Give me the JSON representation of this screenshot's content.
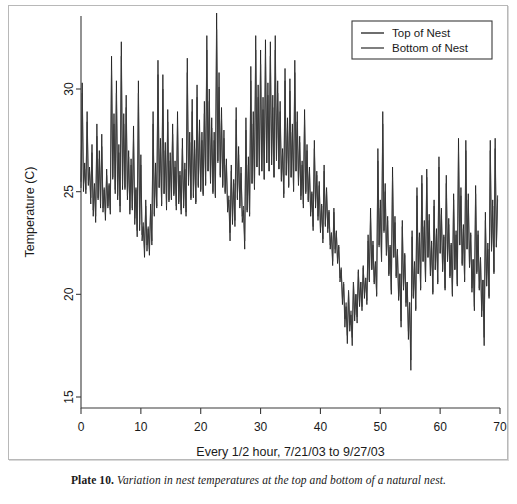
{
  "caption": {
    "plate": "Plate 10.",
    "text": "Variation in nest temperatures at the top and bottom of a natural nest."
  },
  "chart_data": {
    "type": "line",
    "title": "",
    "xlabel": "Every 1/2 hour, 7/21/03 to 9/27/03",
    "ylabel": "Temperature (C)",
    "xlim": [
      0,
      70
    ],
    "ylim": [
      15,
      33.8
    ],
    "xticks": [
      0,
      10,
      20,
      30,
      40,
      50,
      60,
      70
    ],
    "yticks": [
      15,
      20,
      25,
      30
    ],
    "xticklabels": [
      "0",
      "10",
      "20",
      "30",
      "40",
      "50",
      "60",
      "70"
    ],
    "yticklabels": [
      "15",
      "20",
      "25",
      "30"
    ],
    "grid": false,
    "legend_position": "top-right",
    "legend_entries": [
      "Top of Nest",
      "Bottom of Nest"
    ],
    "colors": {
      "top": "#1f1f1f",
      "bottom": "#3a3a3a",
      "axis": "#3b3b3b",
      "frame": "#b8b8b8"
    },
    "x_start": 0,
    "x_end": 69.6,
    "n_points": 349,
    "series": [
      {
        "name": "Top of Nest",
        "values": [
          25.2,
          30.3,
          25.0,
          26.4,
          24.9,
          28.9,
          25.3,
          26.2,
          24.4,
          27.3,
          23.8,
          25.4,
          23.5,
          28.3,
          24.6,
          27.0,
          24.2,
          27.8,
          24.0,
          25.1,
          23.6,
          26.1,
          24.2,
          25.4,
          23.9,
          31.6,
          25.6,
          28.8,
          24.9,
          30.4,
          24.6,
          27.3,
          24.0,
          32.3,
          25.1,
          28.8,
          25.1,
          29.7,
          24.6,
          27.0,
          23.9,
          26.6,
          24.1,
          28.2,
          23.4,
          25.2,
          22.8,
          30.4,
          23.1,
          26.8,
          22.6,
          23.3,
          21.8,
          24.6,
          22.1,
          23.2,
          21.9,
          24.4,
          22.4,
          28.9,
          23.8,
          26.4,
          24.2,
          31.4,
          25.2,
          27.6,
          24.3,
          30.7,
          24.9,
          27.4,
          24.1,
          29.0,
          24.5,
          26.9,
          24.6,
          28.3,
          24.8,
          26.5,
          24.1,
          28.9,
          24.4,
          26.0,
          23.9,
          27.6,
          24.2,
          26.4,
          23.8,
          31.5,
          25.3,
          27.9,
          24.6,
          29.5,
          24.7,
          27.5,
          24.4,
          30.2,
          25.2,
          28.5,
          25.0,
          27.9,
          24.8,
          29.4,
          25.3,
          32.6,
          26.0,
          30.0,
          25.4,
          28.6,
          24.9,
          27.9,
          24.7,
          33.7,
          26.5,
          30.8,
          25.7,
          29.1,
          25.2,
          28.0,
          24.9,
          26.6,
          24.0,
          24.6,
          22.6,
          26.3,
          23.4,
          25.6,
          23.3,
          29.1,
          24.6,
          27.2,
          24.2,
          26.2,
          23.5,
          24.1,
          22.2,
          28.6,
          24.0,
          26.7,
          23.8,
          31.1,
          25.4,
          28.9,
          25.1,
          32.6,
          26.2,
          30.2,
          25.8,
          31.9,
          26.0,
          29.6,
          25.6,
          32.4,
          26.4,
          30.3,
          26.0,
          32.3,
          26.3,
          29.7,
          25.7,
          32.6,
          26.6,
          30.4,
          26.1,
          29.4,
          25.5,
          27.1,
          24.7,
          31.0,
          25.8,
          28.6,
          25.2,
          30.5,
          25.7,
          28.3,
          25.0,
          31.4,
          26.0,
          28.9,
          25.3,
          27.7,
          24.6,
          26.5,
          24.2,
          29.0,
          24.9,
          27.3,
          24.5,
          26.2,
          23.8,
          25.0,
          23.1,
          27.5,
          24.2,
          26.0,
          23.6,
          25.5,
          23.0,
          24.4,
          22.5,
          26.3,
          23.3,
          25.2,
          23.0,
          24.1,
          22.2,
          23.0,
          21.4,
          24.2,
          22.0,
          23.1,
          21.5,
          22.4,
          20.6,
          21.2,
          19.5,
          20.5,
          18.4,
          19.4,
          17.6,
          20.1,
          18.2,
          19.0,
          17.5,
          20.6,
          18.7,
          20.0,
          18.6,
          21.2,
          19.4,
          20.6,
          19.2,
          21.4,
          19.8,
          20.8,
          19.5,
          22.9,
          20.6,
          24.2,
          21.2,
          22.6,
          20.5,
          21.6,
          19.9,
          27.1,
          22.4,
          24.6,
          21.6,
          28.9,
          23.1,
          25.4,
          21.9,
          23.8,
          20.9,
          22.4,
          20.0,
          26.2,
          21.8,
          23.8,
          20.8,
          22.2,
          19.7,
          21.0,
          18.4,
          23.6,
          20.2,
          22.0,
          19.4,
          20.6,
          17.8,
          19.6,
          16.3,
          23.1,
          19.8,
          21.6,
          19.2,
          25.2,
          21.0,
          23.0,
          20.2,
          25.8,
          21.6,
          23.6,
          20.6,
          26.1,
          21.8,
          23.9,
          20.9,
          22.6,
          20.0,
          24.6,
          21.2,
          23.2,
          20.5,
          26.7,
          22.0,
          24.2,
          21.1,
          22.9,
          20.2,
          25.8,
          21.6,
          23.7,
          20.8,
          22.5,
          19.9,
          24.9,
          21.2,
          23.1,
          20.4,
          27.6,
          22.4,
          25.2,
          21.4,
          23.4,
          20.6,
          27.5,
          22.2,
          24.9,
          21.3,
          23.0,
          20.1,
          21.7,
          19.2,
          25.3,
          21.0,
          23.1,
          20.2,
          21.8,
          18.9,
          20.7,
          17.5,
          24.0,
          20.4,
          22.5,
          19.8,
          27.5,
          22.1,
          24.6,
          21.0,
          27.6,
          22.3,
          24.8
        ]
      },
      {
        "name": "Bottom of Nest",
        "values": [
          25.5,
          29.8,
          25.3,
          26.1,
          25.1,
          28.4,
          25.4,
          26.0,
          24.7,
          26.9,
          24.1,
          25.3,
          23.8,
          27.7,
          24.7,
          26.6,
          24.4,
          27.2,
          24.2,
          25.2,
          23.9,
          25.8,
          24.3,
          25.3,
          24.1,
          30.9,
          25.7,
          28.3,
          25.1,
          29.8,
          24.8,
          26.9,
          24.3,
          31.6,
          25.3,
          28.3,
          25.2,
          29.1,
          24.8,
          26.7,
          24.1,
          26.3,
          24.2,
          27.6,
          23.7,
          25.1,
          23.1,
          29.8,
          23.4,
          26.3,
          22.9,
          23.5,
          22.2,
          24.3,
          22.4,
          23.3,
          22.2,
          24.1,
          22.6,
          28.3,
          23.9,
          26.0,
          24.3,
          30.7,
          25.2,
          27.1,
          24.4,
          30.0,
          24.9,
          27.0,
          24.3,
          28.4,
          24.6,
          26.5,
          24.7,
          27.8,
          24.9,
          26.2,
          24.3,
          28.3,
          24.5,
          25.8,
          24.1,
          27.1,
          24.3,
          26.1,
          24.0,
          30.8,
          25.4,
          27.4,
          24.7,
          28.9,
          24.8,
          27.1,
          24.5,
          29.6,
          25.3,
          28.0,
          25.1,
          27.5,
          24.9,
          28.8,
          25.4,
          31.9,
          26.0,
          29.4,
          25.5,
          28.1,
          25.0,
          27.5,
          24.8,
          32.9,
          26.4,
          30.1,
          25.8,
          28.6,
          25.3,
          27.6,
          25.0,
          26.3,
          24.2,
          24.8,
          23.0,
          26.0,
          23.7,
          25.4,
          23.6,
          28.5,
          24.7,
          26.8,
          24.3,
          25.9,
          23.8,
          24.3,
          22.6,
          28.0,
          24.1,
          26.3,
          23.9,
          30.4,
          25.4,
          28.3,
          25.2,
          31.9,
          26.2,
          29.6,
          25.8,
          31.2,
          26.0,
          29.0,
          25.6,
          31.7,
          26.4,
          29.7,
          26.0,
          31.6,
          26.3,
          29.1,
          25.7,
          31.9,
          26.5,
          29.8,
          26.1,
          28.9,
          25.6,
          26.9,
          24.9,
          30.4,
          25.8,
          28.1,
          25.3,
          29.9,
          25.7,
          27.9,
          25.1,
          30.8,
          26.0,
          28.4,
          25.4,
          27.4,
          24.8,
          26.3,
          24.4,
          28.5,
          25.0,
          27.0,
          24.6,
          26.0,
          24.0,
          24.9,
          23.3,
          27.1,
          24.3,
          25.8,
          23.8,
          25.3,
          23.2,
          24.3,
          22.7,
          26.0,
          23.4,
          25.0,
          23.2,
          24.0,
          22.4,
          23.0,
          21.6,
          24.0,
          22.2,
          23.0,
          21.7,
          22.3,
          20.8,
          21.3,
          19.8,
          20.6,
          18.8,
          19.6,
          18.0,
          20.2,
          18.5,
          19.2,
          17.9,
          20.6,
          19.0,
          20.0,
          18.9,
          21.1,
          19.6,
          20.6,
          19.4,
          21.3,
          20.0,
          20.8,
          19.7,
          22.6,
          20.7,
          23.7,
          21.2,
          22.4,
          20.6,
          21.5,
          20.0,
          26.5,
          22.3,
          24.2,
          21.6,
          28.3,
          23.0,
          25.0,
          21.9,
          23.6,
          21.0,
          22.3,
          20.2,
          25.7,
          21.8,
          23.5,
          20.9,
          22.1,
          19.9,
          21.0,
          18.7,
          23.3,
          20.3,
          21.9,
          19.6,
          20.6,
          18.2,
          19.6,
          16.8,
          22.8,
          19.9,
          21.4,
          19.3,
          24.8,
          21.0,
          22.8,
          20.3,
          25.4,
          21.6,
          23.3,
          20.7,
          25.7,
          21.8,
          23.6,
          21.0,
          22.5,
          20.1,
          24.3,
          21.2,
          23.0,
          20.6,
          26.2,
          22.0,
          23.9,
          21.2,
          22.8,
          20.3,
          25.4,
          21.6,
          23.4,
          20.9,
          22.4,
          20.0,
          24.6,
          21.2,
          22.9,
          20.5,
          27.0,
          22.4,
          24.8,
          21.5,
          23.2,
          20.7,
          27.0,
          22.2,
          24.6,
          21.4,
          22.9,
          20.3,
          21.7,
          19.4,
          24.9,
          21.1,
          22.9,
          20.3,
          21.7,
          19.2,
          20.7,
          17.9,
          23.6,
          20.4,
          22.2,
          19.9,
          27.0,
          22.1,
          24.3,
          21.1,
          27.1,
          22.3,
          24.6
        ]
      }
    ]
  }
}
